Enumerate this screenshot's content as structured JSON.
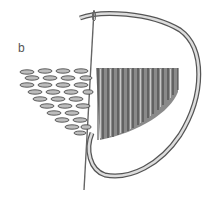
{
  "figure": {
    "label": "b",
    "colors": {
      "ink": "#3a3a3a",
      "fill_light": "#b8b8b8",
      "fill_dark": "#6e6e6e",
      "thread": "#cfcfcf"
    }
  }
}
